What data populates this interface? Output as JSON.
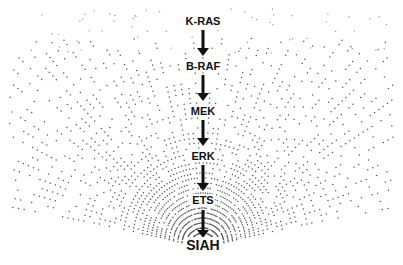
{
  "diagram": {
    "type": "signaling-pathway-funnel",
    "nodes": [
      {
        "label": "K-RAS",
        "y": 22
      },
      {
        "label": "B-RAF",
        "y": 67
      },
      {
        "label": "MEK",
        "y": 112
      },
      {
        "label": "ERK",
        "y": 157
      },
      {
        "label": "ETS",
        "y": 201
      },
      {
        "label": "SIAH",
        "y": 245
      }
    ],
    "edges": [
      {
        "from": "K-RAS",
        "to": "B-RAF"
      },
      {
        "from": "B-RAF",
        "to": "MEK"
      },
      {
        "from": "MEK",
        "to": "ERK"
      },
      {
        "from": "ERK",
        "to": "ETS"
      },
      {
        "from": "ETS",
        "to": "SIAH"
      }
    ],
    "colors": {
      "dots": "#555555",
      "text": "#111111",
      "arrow": "#111111",
      "background": "#ffffff"
    }
  }
}
